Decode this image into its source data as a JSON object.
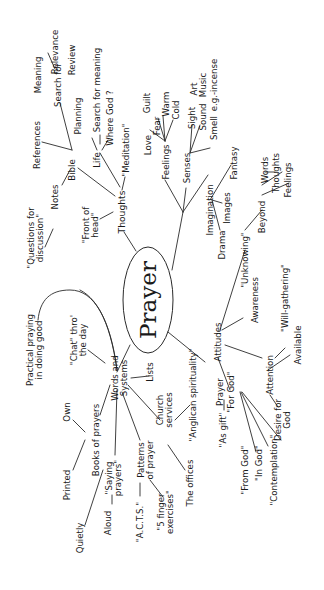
{
  "diagram": {
    "type": "mind-map",
    "orientation": "rotated 90 degrees counter-clockwise",
    "ink_color": "#1a1a1a",
    "background": "#ffffff",
    "center": "Prayer",
    "branches": {
      "thoughts": {
        "label": "Thoughts",
        "front_of_head": "\"Front of head\"",
        "meditation": "\"Meditation\"",
        "bible": "Bible",
        "notes": "Notes",
        "questions": "\"Questions for discussion\"",
        "references": "References",
        "search_for": "Search for",
        "meaning": "Meaning",
        "relevance": "Relevance",
        "life": "Life",
        "planning": "Planning",
        "review": "Review",
        "search_for_meaning": "Search for meaning",
        "where_god": "Where God ?"
      },
      "imagination": {
        "label": "Imagination",
        "feelings": "Feelings",
        "love": "Love",
        "fear": "Fear",
        "guilt": "Guilt",
        "warm": "Warm",
        "cold": "Cold",
        "senses": "Senses",
        "sight": "Sight",
        "art": "Art",
        "sound": "Sound",
        "music": "Music",
        "smell": "Smell",
        "incense": "e.g.-incense",
        "fantasy": "Fantasy",
        "images": "Images",
        "drama": "Drama"
      },
      "attitudes": {
        "label": "Attitudes",
        "unknowing": "\"Unknowing\"",
        "beyond": "Beyond",
        "words": "Words",
        "thoughts": "Thoughts",
        "feelings": "Feelings",
        "awareness": "Awareness",
        "will_gathering": "\"Will-gathering\"",
        "attention": "Attention",
        "available": "Available",
        "desire_for_god": "Desire for God",
        "prayer": "Prayer",
        "for_god": "\"For God\"",
        "as_gift": "\"As gift\"",
        "from_god": "\"From God\"",
        "in_god": "\"In God\"",
        "contemplation": "\"Contemplation\""
      },
      "words_and_systems": {
        "label": "Words and Systems",
        "chat": "\"Chat\" thro' the day",
        "lists": "Lists",
        "church_services": "Church services",
        "anglican": "\"Anglican spirituality\"",
        "the_offices": "The offices",
        "books_of_prayers": "Books of prayers",
        "own": "Own",
        "printed": "Printed",
        "saying_prayers": "\"Saying prayers\"",
        "aloud": "Aloud",
        "quietly": "Quietly",
        "patterns": "Patterns of prayer",
        "acts": "\"A.C.T.S.\"",
        "five_finger": "\"5 finger exercises\""
      },
      "practical": {
        "label": "Practical praying in doing good"
      }
    }
  }
}
